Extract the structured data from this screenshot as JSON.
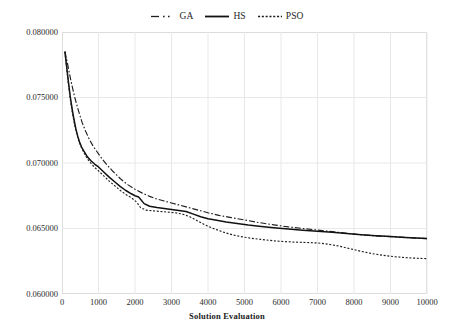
{
  "chart_data": {
    "type": "line",
    "title": "",
    "xlabel": "Solution Evaluation",
    "ylabel": "",
    "xlim": [
      0,
      10000
    ],
    "ylim": [
      0.06,
      0.08
    ],
    "grid": true,
    "legend_position": "top-center",
    "x_ticks": [
      0,
      1000,
      2000,
      3000,
      4000,
      5000,
      6000,
      7000,
      8000,
      9000,
      10000
    ],
    "x_tick_labels": [
      "0",
      "1000",
      "2000",
      "3000",
      "4000",
      "5000",
      "6000",
      "7000",
      "8000",
      "9000",
      "10000"
    ],
    "y_ticks": [
      0.06,
      0.065,
      0.07,
      0.075,
      0.08
    ],
    "y_tick_labels": [
      "0.060000",
      "0.065000",
      "0.070000",
      "0.075000",
      "0.080000"
    ],
    "series": [
      {
        "name": "GA",
        "style": "dash-dot",
        "color": "#1f1f1f",
        "x": [
          80,
          150,
          250,
          350,
          450,
          550,
          650,
          750,
          850,
          950,
          1100,
          1250,
          1400,
          1600,
          1800,
          2000,
          2200,
          2400,
          2600,
          2800,
          3000,
          3200,
          3400,
          3600,
          3800,
          4000,
          4300,
          4600,
          5000,
          5400,
          5800,
          6200,
          6600,
          7000,
          7400,
          7800,
          8200,
          8600,
          9000,
          9400,
          9700,
          10000
        ],
        "y": [
          0.0785,
          0.0776,
          0.0762,
          0.075,
          0.074,
          0.0731,
          0.0724,
          0.0718,
          0.0713,
          0.0709,
          0.0703,
          0.0698,
          0.06935,
          0.0688,
          0.06835,
          0.068,
          0.0677,
          0.06745,
          0.06725,
          0.0671,
          0.06695,
          0.0668,
          0.06665,
          0.0665,
          0.06635,
          0.0662,
          0.066,
          0.06585,
          0.06565,
          0.06545,
          0.06528,
          0.06512,
          0.065,
          0.06488,
          0.06476,
          0.06464,
          0.06452,
          0.06444,
          0.06438,
          0.06432,
          0.06427,
          0.06423
        ]
      },
      {
        "name": "HS",
        "style": "solid",
        "color": "#111111",
        "x": [
          80,
          130,
          180,
          230,
          280,
          330,
          380,
          430,
          480,
          540,
          600,
          700,
          800,
          900,
          1000,
          1150,
          1300,
          1450,
          1600,
          1750,
          1900,
          2000,
          2100,
          2250,
          2400,
          2600,
          2800,
          3000,
          3200,
          3400,
          3600,
          3800,
          4000,
          4200,
          4500,
          4800,
          5100,
          5400,
          5800,
          6200,
          6600,
          7000,
          7400,
          7800,
          8200,
          8600,
          9000,
          9400,
          9700,
          10000
        ],
        "y": [
          0.0785,
          0.0773,
          0.0761,
          0.075,
          0.0741,
          0.0733,
          0.0726,
          0.07205,
          0.0716,
          0.0712,
          0.0709,
          0.07045,
          0.07015,
          0.0699,
          0.0697,
          0.0693,
          0.0689,
          0.06855,
          0.0682,
          0.0679,
          0.06765,
          0.0675,
          0.0674,
          0.0669,
          0.0667,
          0.0666,
          0.06652,
          0.06645,
          0.06638,
          0.0663,
          0.0661,
          0.0659,
          0.06575,
          0.06565,
          0.0655,
          0.06538,
          0.06527,
          0.06518,
          0.06506,
          0.06496,
          0.06487,
          0.06479,
          0.06471,
          0.06462,
          0.06452,
          0.06444,
          0.06438,
          0.06432,
          0.06427,
          0.06423
        ]
      },
      {
        "name": "PSO",
        "style": "dotted",
        "color": "#1f1f1f",
        "x": [
          80,
          130,
          180,
          230,
          280,
          340,
          400,
          460,
          520,
          600,
          700,
          800,
          900,
          1000,
          1150,
          1300,
          1450,
          1600,
          1750,
          1900,
          2050,
          2150,
          2300,
          2500,
          2700,
          2900,
          3100,
          3300,
          3500,
          3700,
          3900,
          4100,
          4300,
          4500,
          4700,
          4900,
          5200,
          5500,
          5800,
          6100,
          6400,
          6700,
          7000,
          7300,
          7600,
          7900,
          8200,
          8500,
          8800,
          9100,
          9400,
          9700,
          10000
        ],
        "y": [
          0.0785,
          0.0772,
          0.0759,
          0.0748,
          0.0739,
          0.073,
          0.0723,
          0.0717,
          0.07125,
          0.0708,
          0.0703,
          0.06995,
          0.06965,
          0.0694,
          0.069,
          0.0686,
          0.06825,
          0.0679,
          0.0676,
          0.06735,
          0.067,
          0.0666,
          0.0664,
          0.06635,
          0.0663,
          0.06625,
          0.0662,
          0.0661,
          0.0659,
          0.0656,
          0.0653,
          0.06505,
          0.06485,
          0.06465,
          0.0645,
          0.06438,
          0.06425,
          0.06415,
          0.06406,
          0.064,
          0.06396,
          0.06393,
          0.0639,
          0.0638,
          0.06365,
          0.06345,
          0.06325,
          0.06308,
          0.06295,
          0.06285,
          0.06278,
          0.06273,
          0.0627
        ]
      }
    ]
  },
  "legend": {
    "items": [
      {
        "label": "GA",
        "style": "dash-dot"
      },
      {
        "label": "HS",
        "style": "solid"
      },
      {
        "label": "PSO",
        "style": "dotted"
      }
    ]
  },
  "axes": {
    "x_title": "Solution Evaluation"
  },
  "colors": {
    "line": "#1f1f1f",
    "grid": "#e8e8e8",
    "frame": "#dcdcdc",
    "text": "#2b2b2b",
    "background": "#ffffff"
  }
}
